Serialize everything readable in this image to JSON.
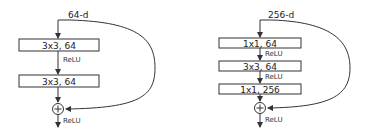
{
  "left_block": {
    "input_dim": "64-d",
    "layers": [
      {
        "label": "3x3, 64"
      },
      {
        "label": "3x3, 64"
      }
    ],
    "activations": [
      "ReLU",
      "ReLU"
    ],
    "add_symbol": "+"
  },
  "right_block": {
    "input_dim": "256-d",
    "layers": [
      {
        "label": "1x1, 64"
      },
      {
        "label": "3x3, 64"
      },
      {
        "label": "1x1, 256"
      }
    ],
    "activations": [
      "ReLU",
      "ReLU",
      "ReLU"
    ],
    "add_symbol": "+"
  },
  "colors": {
    "stroke": "#333333",
    "background": "#ffffff"
  }
}
